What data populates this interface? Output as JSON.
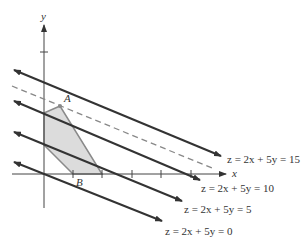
{
  "figure": {
    "axes": {
      "x_label": "x",
      "y_label": "y",
      "origin_px": [
        44,
        174
      ],
      "x_ticks_px": [
        73,
        102,
        132,
        161,
        191
      ],
      "y_ticks_px": [
        52
      ]
    },
    "points": {
      "A": {
        "label": "A",
        "px": [
          60,
          106
        ]
      },
      "B": {
        "label": "B",
        "px": [
          73,
          174
        ]
      }
    },
    "feasible_region": {
      "vertices_px": [
        [
          44,
          113
        ],
        [
          60,
          106
        ],
        [
          102,
          174
        ],
        [
          73,
          174
        ],
        [
          44,
          145
        ]
      ],
      "fill": "#dcdcdc",
      "stroke": "#8a8a8a"
    },
    "level_lines": [
      {
        "label": "z = 2x + 5y = 15",
        "value": 15,
        "start_px": [
          14,
          70
        ],
        "end_px": [
          221,
          156
        ],
        "label_px": [
          227,
          163
        ]
      },
      {
        "label": "z = 2x + 5y = 10",
        "value": 10,
        "start_px": [
          14,
          101
        ],
        "end_px": [
          200,
          180
        ],
        "label_px": [
          201,
          192
        ]
      },
      {
        "label": "z = 2x + 5y = 5",
        "value": 5,
        "start_px": [
          14,
          132
        ],
        "end_px": [
          182,
          201
        ],
        "label_px": [
          184,
          213
        ]
      },
      {
        "label": "z = 2x + 5y = 0",
        "value": 0,
        "start_px": [
          14,
          162
        ],
        "end_px": [
          162,
          221
        ],
        "label_px": [
          165,
          235
        ]
      }
    ],
    "dashed_line": {
      "start_px": [
        12,
        86
      ],
      "end_px": [
        212,
        168
      ]
    },
    "colors": {
      "line": "#333333",
      "dashed": "#888888",
      "axis": "#444444"
    }
  }
}
